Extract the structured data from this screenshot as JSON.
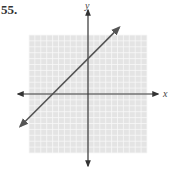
{
  "problem": {
    "number": "55."
  },
  "chart_data": {
    "type": "line",
    "title": "",
    "xlabel": "x",
    "ylabel": "y",
    "xlim": [
      -10,
      10
    ],
    "ylim": [
      -10,
      10
    ],
    "grid": true,
    "tick_labels": false,
    "series": [
      {
        "name": "line",
        "equation": "y = x + 6",
        "slope": 1,
        "intercept": 6,
        "x": [
          -11.5,
          5.3
        ],
        "y": [
          -5.5,
          11.3
        ],
        "arrows_both_ends": true
      }
    ],
    "axis_labels": {
      "x": "x",
      "y": "y"
    }
  },
  "colors": {
    "grid_bg": "#e4e4e4",
    "grid_line": "#f7f7f7",
    "axis": "#333333",
    "line": "#555555"
  }
}
